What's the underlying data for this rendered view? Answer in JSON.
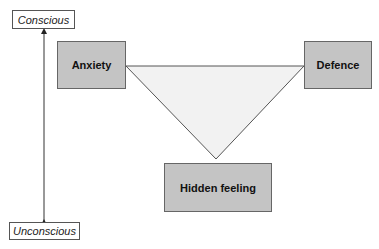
{
  "axis": {
    "top_label": "Conscious",
    "bottom_label": "Unconscious"
  },
  "nodes": {
    "anxiety": "Anxiety",
    "defence": "Defence",
    "hidden_feeling": "Hidden feeling"
  },
  "colors": {
    "node_fill": "#c4c4c4",
    "triangle_fill": "#f2f2f2",
    "stroke": "#555555"
  }
}
